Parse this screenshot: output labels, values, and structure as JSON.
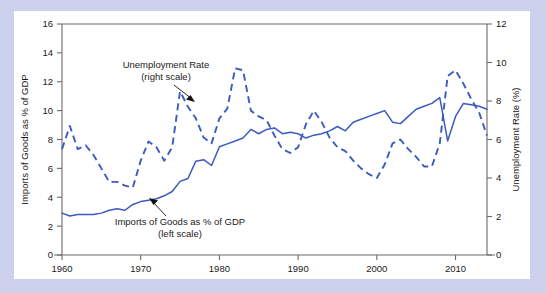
{
  "figure": {
    "background_color": "#ccd2ee",
    "card_color": "#ffffff",
    "series_color": "#3b5bbf",
    "axis_color": "#6b6b6b"
  },
  "annotations": {
    "unemployment": {
      "line1": "Unemployment Rate",
      "line2": "(right scale)"
    },
    "imports": {
      "line1": "Imports of Goods as % of GDP",
      "line2": "(left scale)"
    }
  },
  "chart_data": {
    "type": "line",
    "title": "",
    "xlabel": "",
    "ylabel": "Imports of Goods as % of GDP",
    "y2label": "Unemployment Rate (%)",
    "xlim": [
      1960,
      2014
    ],
    "ylim": [
      0,
      16
    ],
    "y2lim": [
      0,
      12
    ],
    "xticks": [
      1960,
      1970,
      1980,
      1990,
      2000,
      2010
    ],
    "xticklabels": [
      "1960",
      "1970",
      "1980",
      "1990",
      "2000",
      "2010"
    ],
    "yticks": [
      0,
      2,
      4,
      6,
      8,
      10,
      12,
      14,
      16
    ],
    "yticklabels": [
      "0",
      "2",
      "4",
      "6",
      "8",
      "10",
      "12",
      "14",
      "16"
    ],
    "y2ticks": [
      0,
      2,
      4,
      6,
      8,
      10,
      12
    ],
    "y2ticklabels": [
      "0",
      "2",
      "4",
      "6",
      "8",
      "10",
      "12"
    ],
    "grid": false,
    "legend_position": "inline-annotations",
    "x": [
      1960,
      1961,
      1962,
      1963,
      1964,
      1965,
      1966,
      1967,
      1968,
      1969,
      1970,
      1971,
      1972,
      1973,
      1974,
      1975,
      1976,
      1977,
      1978,
      1979,
      1980,
      1981,
      1982,
      1983,
      1984,
      1985,
      1986,
      1987,
      1988,
      1989,
      1990,
      1991,
      1992,
      1993,
      1994,
      1995,
      1996,
      1997,
      1998,
      1999,
      2000,
      2001,
      2002,
      2003,
      2004,
      2005,
      2006,
      2007,
      2008,
      2009,
      2010,
      2011,
      2012,
      2013,
      2014
    ],
    "series": [
      {
        "name": "Imports of Goods as % of GDP",
        "axis": "left",
        "style": "solid",
        "units": "% of GDP",
        "values": [
          2.9,
          2.7,
          2.8,
          2.8,
          2.8,
          2.9,
          3.1,
          3.2,
          3.1,
          3.5,
          3.7,
          3.8,
          3.9,
          4.1,
          4.4,
          5.1,
          5.3,
          6.5,
          6.6,
          6.2,
          7.5,
          7.7,
          7.9,
          8.1,
          8.7,
          8.4,
          8.7,
          8.8,
          8.4,
          8.5,
          8.4,
          8.1,
          8.3,
          8.4,
          8.6,
          8.9,
          8.6,
          9.2,
          9.4,
          9.6,
          9.8,
          10.0,
          9.2,
          9.1,
          9.6,
          10.1,
          10.3,
          10.5,
          10.9,
          7.9,
          9.6,
          10.5,
          10.4,
          10.3,
          10.1
        ]
      },
      {
        "name": "Unemployment Rate",
        "axis": "right",
        "style": "dashed",
        "units": "%",
        "values": [
          5.5,
          6.7,
          5.5,
          5.7,
          5.2,
          4.5,
          3.8,
          3.8,
          3.6,
          3.5,
          4.9,
          5.9,
          5.6,
          4.9,
          5.6,
          8.5,
          7.7,
          7.1,
          6.1,
          5.8,
          7.1,
          7.6,
          9.7,
          9.6,
          7.5,
          7.2,
          7.0,
          6.2,
          5.5,
          5.3,
          5.6,
          6.8,
          7.5,
          6.9,
          6.1,
          5.6,
          5.4,
          4.9,
          4.5,
          4.2,
          4.0,
          4.7,
          5.8,
          6.0,
          5.5,
          5.1,
          4.6,
          4.6,
          5.8,
          9.3,
          9.6,
          8.9,
          8.1,
          7.4,
          6.2
        ]
      }
    ]
  }
}
